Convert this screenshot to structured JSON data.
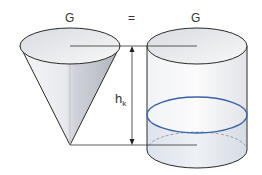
{
  "labels": {
    "left_quantity": "G",
    "equals": "=",
    "right_quantity": "G",
    "height_symbol": "h",
    "height_subscript": "k"
  },
  "shapes": {
    "left": "cone",
    "right": "cylinder",
    "fill_level_color": "#3a62a8",
    "outline_color": "#2a2a2a"
  }
}
